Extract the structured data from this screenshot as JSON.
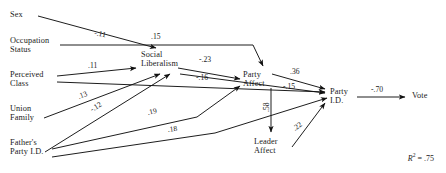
{
  "diagram": {
    "type": "path-diagram",
    "fit_statistic": {
      "symbol": "R",
      "exponent": "2",
      "equals": " = ",
      "value": ".75",
      "full": "R2 = .75"
    },
    "nodes": [
      {
        "id": "sex",
        "label": "Sex",
        "x": 10,
        "y": 10
      },
      {
        "id": "occupation_status",
        "label": "Occupation\nStatus",
        "x": 10,
        "y": 36
      },
      {
        "id": "perceived_class",
        "label": "Perceived\nClass",
        "x": 10,
        "y": 70
      },
      {
        "id": "union_family",
        "label": "Union\nFamily",
        "x": 10,
        "y": 104
      },
      {
        "id": "fathers_party_id",
        "label": "Father's\nParty I.D.",
        "x": 10,
        "y": 138
      },
      {
        "id": "social_liberalism",
        "label": "Social\nLiberalism",
        "x": 141,
        "y": 50
      },
      {
        "id": "party_affect",
        "label": "Party\nAffect",
        "x": 243,
        "y": 70
      },
      {
        "id": "leader_affect",
        "label": "Leader\nAffect",
        "x": 254,
        "y": 137
      },
      {
        "id": "party_id",
        "label": "Party\nI.D.",
        "x": 330,
        "y": 87
      },
      {
        "id": "vote",
        "label": "Vote",
        "x": 412,
        "y": 95
      }
    ],
    "edges": [
      {
        "id": "sex-to-social-liberalism",
        "from": "sex",
        "to": "social_liberalism",
        "coefficient": "-.11"
      },
      {
        "id": "occupation-status-to-party-affect",
        "from": "occupation_status",
        "to": "party_affect",
        "coefficient": ".15"
      },
      {
        "id": "perceived-class-to-social-liberalism",
        "from": "perceived_class",
        "to": "social_liberalism",
        "coefficient": ".11"
      },
      {
        "id": "union-family-to-social-liberalism",
        "from": "union_family",
        "to": "social_liberalism",
        "coefficient": ".13"
      },
      {
        "id": "fathers-party-id-to-social-liberalism",
        "from": "fathers_party_id",
        "to": "social_liberalism",
        "coefficient": "-.12"
      },
      {
        "id": "fathers-party-id-to-party-affect",
        "from": "fathers_party_id",
        "to": "party_affect",
        "coefficient": ".19"
      },
      {
        "id": "fathers-party-id-to-party-id",
        "from": "fathers_party_id",
        "to": "party_id",
        "coefficient": ".18"
      },
      {
        "id": "social-liberalism-to-party-affect",
        "from": "social_liberalism",
        "to": "party_affect",
        "coefficient": "-.23"
      },
      {
        "id": "social-liberalism-to-party-id",
        "from": "social_liberalism",
        "to": "party_id",
        "coefficient": "-.16"
      },
      {
        "id": "party-affect-to-party-id",
        "from": "party_affect",
        "to": "party_id",
        "coefficient": ".36"
      },
      {
        "id": "perceived-class-to-party-id",
        "from": "perceived_class",
        "to": "party_id",
        "coefficient": "-.15"
      },
      {
        "id": "party-affect-to-leader-affect",
        "from": "party_affect",
        "to": "leader_affect",
        "coefficient": ".58"
      },
      {
        "id": "leader-affect-to-party-id",
        "from": "leader_affect",
        "to": "party_id",
        "coefficient": ".22"
      },
      {
        "id": "party-id-to-vote",
        "from": "party_id",
        "to": "vote",
        "coefficient": "-.70"
      }
    ]
  }
}
